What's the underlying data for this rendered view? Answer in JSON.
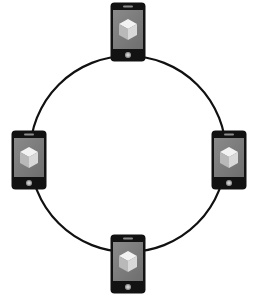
{
  "diagram": {
    "type": "ring-network",
    "description": "Four smartphones connected in a ring topology",
    "ring": {
      "cx": 128,
      "cy": 154,
      "r": 98,
      "stroke": "#111111",
      "stroke_width": 2.2
    },
    "colors": {
      "phone_body": "#121212",
      "screen": "#6e6e6e",
      "screen_light": "#8a8a8a",
      "cube_top": "#f2f2f2",
      "cube_left": "#b9b9b9",
      "cube_right": "#d8d8d8",
      "speaker": "#8c8c8c",
      "home_button": "#9a9a9a"
    },
    "nodes": [
      {
        "id": "top",
        "label": "phone-top",
        "x": 110,
        "y": 2
      },
      {
        "id": "left",
        "label": "phone-left",
        "x": 11,
        "y": 130
      },
      {
        "id": "right",
        "label": "phone-right",
        "x": 211,
        "y": 130
      },
      {
        "id": "bottom",
        "label": "phone-bottom",
        "x": 110,
        "y": 234
      }
    ],
    "icon": "cube-icon"
  }
}
